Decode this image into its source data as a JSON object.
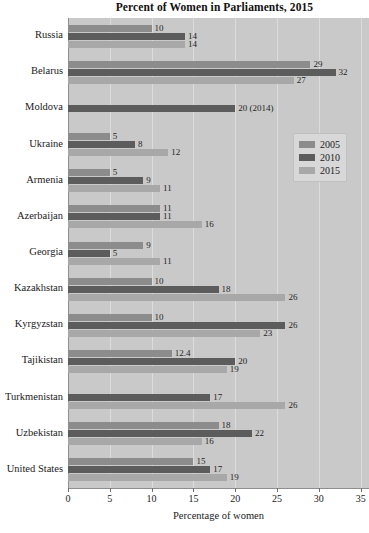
{
  "chart_data": {
    "type": "bar",
    "orientation": "horizontal",
    "title": "Percent of Women in Parliaments, 2015",
    "xlabel": "Percentage of women",
    "ylabel": "",
    "xlim": [
      0,
      36
    ],
    "xticks": [
      0,
      5,
      10,
      15,
      20,
      25,
      30,
      35
    ],
    "grid": true,
    "legend_position": "right",
    "categories": [
      "Russia",
      "Belarus",
      "Moldova",
      "Ukraine",
      "Armenia",
      "Azerbaijan",
      "Georgia",
      "Kazakhstan",
      "Kyrgyzstan",
      "Tajikistan",
      "Turkmenistan",
      "Uzbekistan",
      "United States"
    ],
    "series": [
      {
        "name": "2005",
        "color": "#8c8c8c",
        "values": [
          10,
          29,
          null,
          5,
          5,
          11,
          9,
          10,
          10,
          12.4,
          null,
          18,
          15
        ],
        "labels": [
          "10",
          "29",
          "",
          "5",
          "5",
          "11",
          "9",
          "10",
          "10",
          "12.4",
          "",
          "18",
          "15"
        ]
      },
      {
        "name": "2010",
        "color": "#5c5c5c",
        "values": [
          14,
          32,
          20,
          8,
          9,
          11,
          5,
          18,
          26,
          20,
          17,
          22,
          17
        ],
        "labels": [
          "14",
          "32",
          "20 (2014)",
          "8",
          "9",
          "11",
          "5",
          "18",
          "26",
          "20",
          "17",
          "22",
          "17"
        ]
      },
      {
        "name": "2015",
        "color": "#a8a8a8",
        "values": [
          14,
          27,
          null,
          12,
          11,
          16,
          11,
          26,
          23,
          19,
          26,
          16,
          19
        ],
        "labels": [
          "14",
          "27",
          "",
          "12",
          "11",
          "16",
          "11",
          "26",
          "23",
          "19",
          "26",
          "16",
          "19"
        ]
      }
    ]
  },
  "legend": {
    "entries": [
      {
        "label": "2005"
      },
      {
        "label": "2010"
      },
      {
        "label": "2015"
      }
    ]
  },
  "colors": {
    "plot_background": "#c9c9c9",
    "gridline": "#dcdcdc",
    "series_2005": "#8c8c8c",
    "series_2010": "#5c5c5c",
    "series_2015": "#a8a8a8",
    "text": "#1a1a1a"
  }
}
